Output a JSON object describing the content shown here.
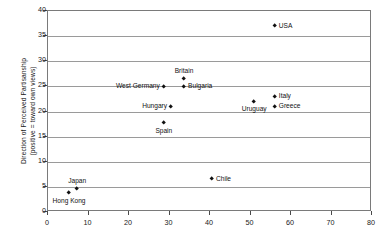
{
  "chart_data": {
    "type": "scatter",
    "title": "",
    "xlabel": "",
    "ylabel": "Direction of Perceived Partisanship (positive = toward own views)",
    "ylabel_line1": "Direction of Perceived Partisanship",
    "ylabel_line2": "(positive = toward own views)",
    "xlim": [
      0,
      80
    ],
    "ylim": [
      0,
      40
    ],
    "xticks": [
      0,
      10,
      20,
      30,
      40,
      50,
      60,
      70,
      80
    ],
    "yticks": [
      0,
      5,
      10,
      15,
      20,
      25,
      30,
      35,
      40
    ],
    "grid": "horizontal",
    "legend": "none",
    "marker": "diamond",
    "marker_color": "#111111",
    "points": [
      {
        "label": "USA",
        "x": 56.0,
        "y": 37.0,
        "label_pos": "right"
      },
      {
        "label": "Britain",
        "x": 33.6,
        "y": 26.5,
        "label_pos": "above"
      },
      {
        "label": "Bulgaria",
        "x": 33.6,
        "y": 25.0,
        "label_pos": "right"
      },
      {
        "label": "West Germany",
        "x": 28.6,
        "y": 25.0,
        "label_pos": "left"
      },
      {
        "label": "Hungary",
        "x": 30.4,
        "y": 21.0,
        "label_pos": "left"
      },
      {
        "label": "Spain",
        "x": 28.6,
        "y": 17.7,
        "label_pos": "below"
      },
      {
        "label": "Uruguay",
        "x": 50.9,
        "y": 22.0,
        "label_pos": "below"
      },
      {
        "label": "Italy",
        "x": 56.0,
        "y": 23.0,
        "label_pos": "right"
      },
      {
        "label": "Greece",
        "x": 56.0,
        "y": 21.0,
        "label_pos": "right"
      },
      {
        "label": "Chile",
        "x": 40.5,
        "y": 6.6,
        "label_pos": "right"
      },
      {
        "label": "Japan",
        "x": 7.2,
        "y": 4.6,
        "label_pos": "above"
      },
      {
        "label": "Hong Kong",
        "x": 5.2,
        "y": 3.8,
        "label_pos": "below"
      }
    ]
  }
}
